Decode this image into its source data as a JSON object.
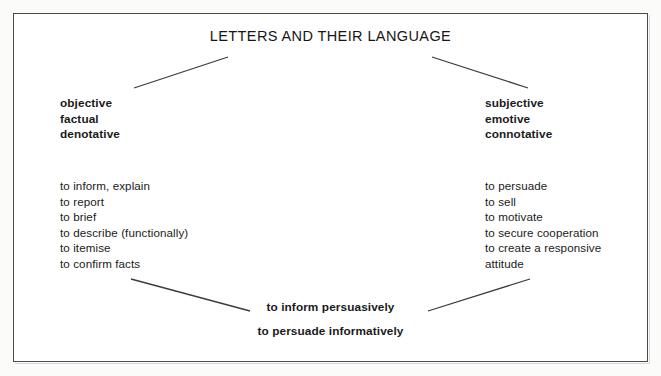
{
  "figure": {
    "title": "LETTERS AND THEIR LANGUAGE",
    "frame_border_color": "#4a4a4a",
    "line_color": "#3c3c3c",
    "background_color": "#ffffff"
  },
  "left_branch": {
    "traits": [
      "objective",
      "factual",
      "denotative"
    ],
    "functions": [
      "to inform, explain",
      "to report",
      "to brief",
      "to describe (functionally)",
      "to itemise",
      "to confirm facts"
    ]
  },
  "right_branch": {
    "traits": [
      "subjective",
      "emotive",
      "connotative"
    ],
    "functions": [
      "to persuade",
      "to sell",
      "to motivate",
      "to secure cooperation",
      "to create a responsive",
      "attitude"
    ]
  },
  "synthesis": {
    "line_1": "to inform persuasively",
    "line_2": "to persuade informatively"
  },
  "connectors": [
    {
      "name": "title-to-left-branch",
      "x1": 228,
      "y1": 57,
      "x2": 134,
      "y2": 88
    },
    {
      "name": "title-to-right-branch",
      "x1": 432,
      "y1": 57,
      "x2": 528,
      "y2": 88
    },
    {
      "name": "left-branch-to-synthesis",
      "x1": 131,
      "y1": 279,
      "x2": 250,
      "y2": 311
    },
    {
      "name": "right-branch-to-synthesis",
      "x1": 530,
      "y1": 279,
      "x2": 428,
      "y2": 311
    }
  ]
}
